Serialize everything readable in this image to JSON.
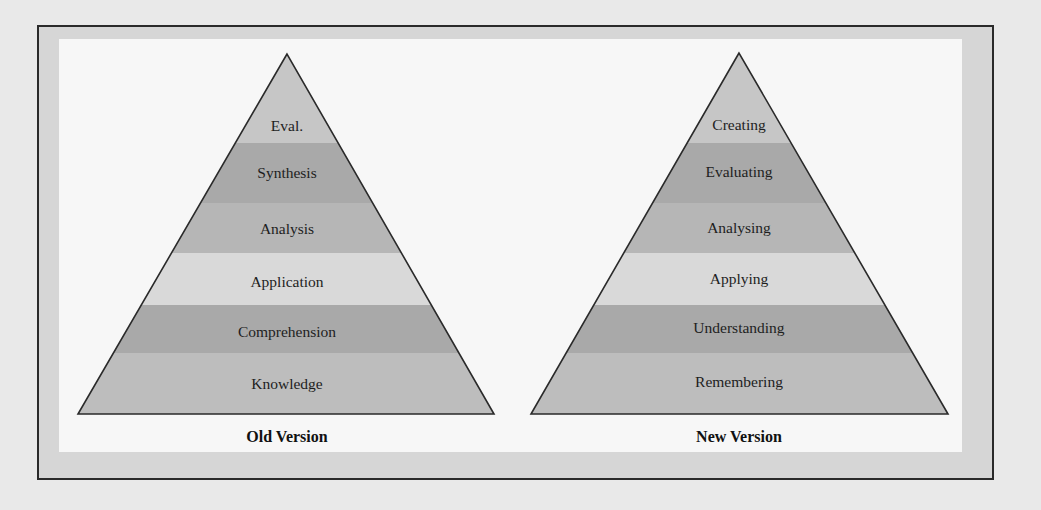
{
  "diagram": {
    "colors": {
      "page_bg": "#e9e9e9",
      "frame_bg": "#d6d6d6",
      "inner_bg": "#f7f7f7",
      "outline": "#2a2a2a",
      "band_top": "#c6c6c6",
      "band_dark": "#a9a9a9",
      "band_medium": "#b6b6b6",
      "band_light": "#d9d9d9",
      "band_bottom": "#bdbdbd"
    },
    "pyramids": [
      {
        "caption": "Old Version",
        "levels": [
          "Eval.",
          "Synthesis",
          "Analysis",
          "Application",
          "Comprehension",
          "Knowledge"
        ]
      },
      {
        "caption": "New Version",
        "levels": [
          "Creating",
          "Evaluating",
          "Analysing",
          "Applying",
          "Understanding",
          "Remembering"
        ]
      }
    ]
  }
}
